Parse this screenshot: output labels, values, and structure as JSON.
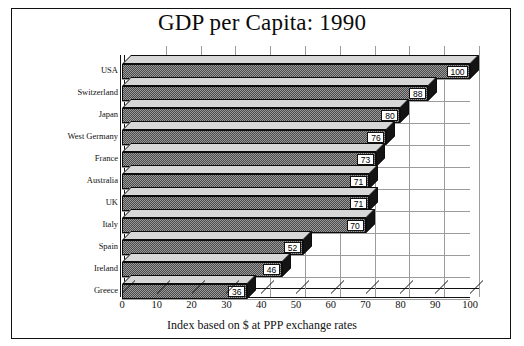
{
  "chart_data": {
    "type": "bar",
    "orientation": "horizontal",
    "title": "GDP per Capita: 1990",
    "xlabel": "Index based on $ at PPP exchange rates",
    "ylabel": "",
    "xlim": [
      0,
      100
    ],
    "xticks": [
      "0",
      "10",
      "20",
      "30",
      "40",
      "50",
      "60",
      "70",
      "80",
      "90",
      "100"
    ],
    "grid": true,
    "legend": null,
    "categories": [
      "USA",
      "Switzerland",
      "Japan",
      "West Germany",
      "France",
      "Australia",
      "UK",
      "Italy",
      "Spain",
      "Ireland",
      "Greece"
    ],
    "values": [
      100,
      88,
      80,
      76,
      73,
      71,
      71,
      70,
      52,
      46,
      36
    ],
    "data_labels": [
      "100",
      "88",
      "80",
      "76",
      "73",
      "71",
      "71",
      "70",
      "52",
      "46",
      "36"
    ],
    "bars": [
      {
        "label": "USA",
        "value": 100,
        "data_label": "100"
      },
      {
        "label": "Switzerland",
        "value": 88,
        "data_label": "88"
      },
      {
        "label": "Japan",
        "value": 80,
        "data_label": "80"
      },
      {
        "label": "West Germany",
        "value": 76,
        "data_label": "76"
      },
      {
        "label": "France",
        "value": 73,
        "data_label": "73"
      },
      {
        "label": "Australia",
        "value": 71,
        "data_label": "71"
      },
      {
        "label": "UK",
        "value": 71,
        "data_label": "71"
      },
      {
        "label": "Italy",
        "value": 70,
        "data_label": "70"
      },
      {
        "label": "Spain",
        "value": 52,
        "data_label": "52"
      },
      {
        "label": "Ireland",
        "value": 46,
        "data_label": "46"
      },
      {
        "label": "Greece",
        "value": 36,
        "data_label": "36"
      }
    ],
    "colors": {
      "background": "#ffffff",
      "frame": "#111111",
      "bar_fill": "#9a9a9a",
      "bar_pattern": "#4a4a4a",
      "bar_top": "#d7d7d7",
      "bar_cap": "#141414",
      "text": "#111111",
      "gridline": "#9c9c9c"
    }
  }
}
